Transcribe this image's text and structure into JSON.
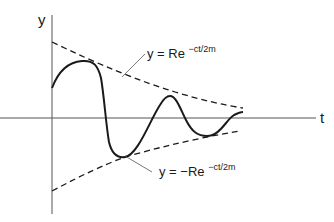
{
  "diagram": {
    "axes": {
      "y_label": "y",
      "x_label": "t"
    },
    "annotations": {
      "upper_envelope": {
        "prefix": "y = Re",
        "exponent": "−ct/2m"
      },
      "lower_envelope": {
        "prefix": "y = −Re",
        "exponent": "−ct/2m"
      }
    },
    "colors": {
      "ink": "#1a1a1a",
      "background": "#ffffff"
    }
  }
}
